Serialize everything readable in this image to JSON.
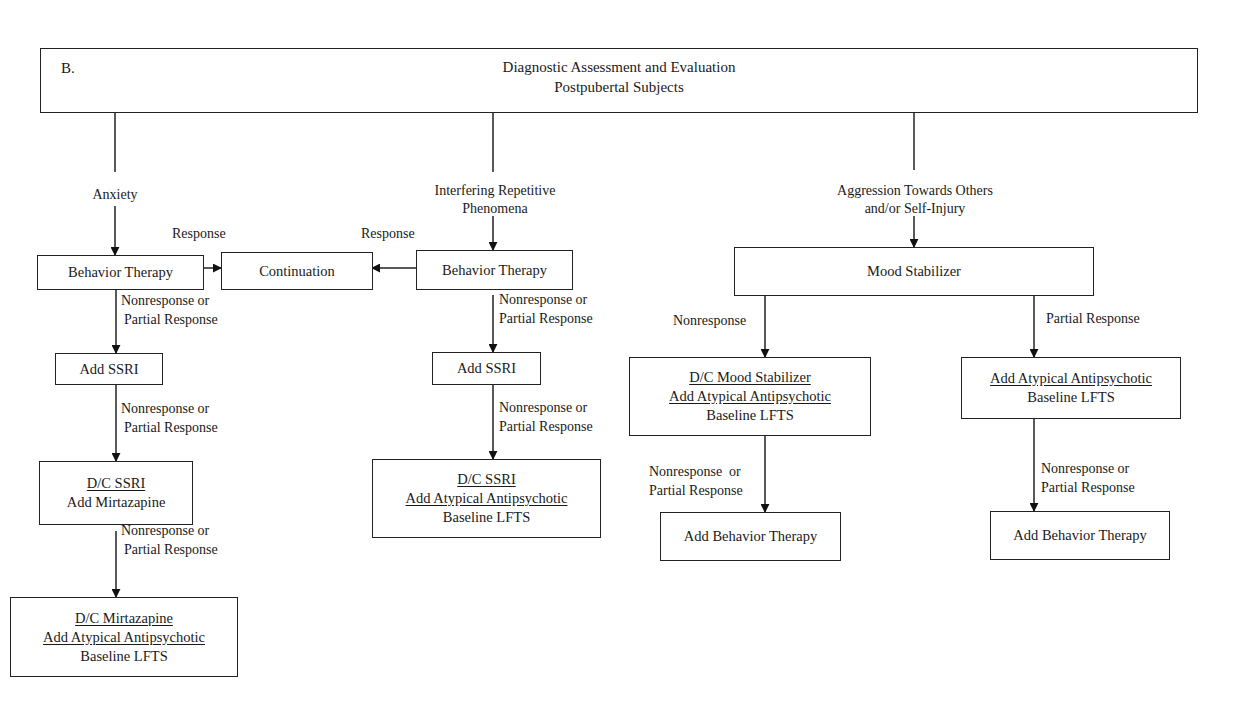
{
  "header": {
    "panel_letter": "B.",
    "title_line1": "Diagnostic Assessment and Evaluation",
    "title_line2": "Postpubertal Subjects"
  },
  "branches": {
    "anxiety": {
      "label": "Anxiety",
      "response_label": "Response",
      "step1": "Behavior Therapy",
      "edge1_line1": "Nonresponse or",
      "edge1_line2": "Partial Response",
      "step2": "Add SSRI",
      "edge2_line1": "Nonresponse or",
      "edge2_line2": "Partial Response",
      "step3_line1": "D/C SSRI",
      "step3_line2": "Add Mirtazapine",
      "edge3_line1": "Nonresponse or",
      "edge3_line2": "Partial Response",
      "step4_line1": "D/C Mirtazapine",
      "step4_line2": "Add Atypical Antipsychotic",
      "step4_line3": "Baseline LFTS"
    },
    "continuation": {
      "label": "Continuation"
    },
    "repetitive": {
      "label_line1": "Interfering Repetitive",
      "label_line2": "Phenomena",
      "response_label": "Response",
      "step1": "Behavior Therapy",
      "edge1_line1": "Nonresponse or",
      "edge1_line2": "Partial Response",
      "step2": "Add SSRI",
      "edge2_line1": "Nonresponse or",
      "edge2_line2": "Partial Response",
      "step3_line1": "D/C SSRI",
      "step3_line2": "Add Atypical Antipsychotic",
      "step3_line3": "Baseline LFTS"
    },
    "aggression": {
      "label_line1": "Aggression Towards Others",
      "label_line2": "and/or Self-Injury",
      "step1": "Mood Stabilizer",
      "left": {
        "edge1": "Nonresponse",
        "step2_line1": "D/C Mood Stabilizer",
        "step2_line2": "Add Atypical Antipsychotic",
        "step2_line3": "Baseline LFTS",
        "edge2_line1": "Nonresponse  or",
        "edge2_line2": "Partial Response",
        "step3": "Add Behavior Therapy"
      },
      "right": {
        "edge1": "Partial Response",
        "step2_line1": "Add Atypical Antipsychotic",
        "step2_line2": "Baseline LFTS",
        "edge2_line1": "Nonresponse or",
        "edge2_line2": "Partial Response",
        "step3": "Add Behavior Therapy"
      }
    }
  }
}
